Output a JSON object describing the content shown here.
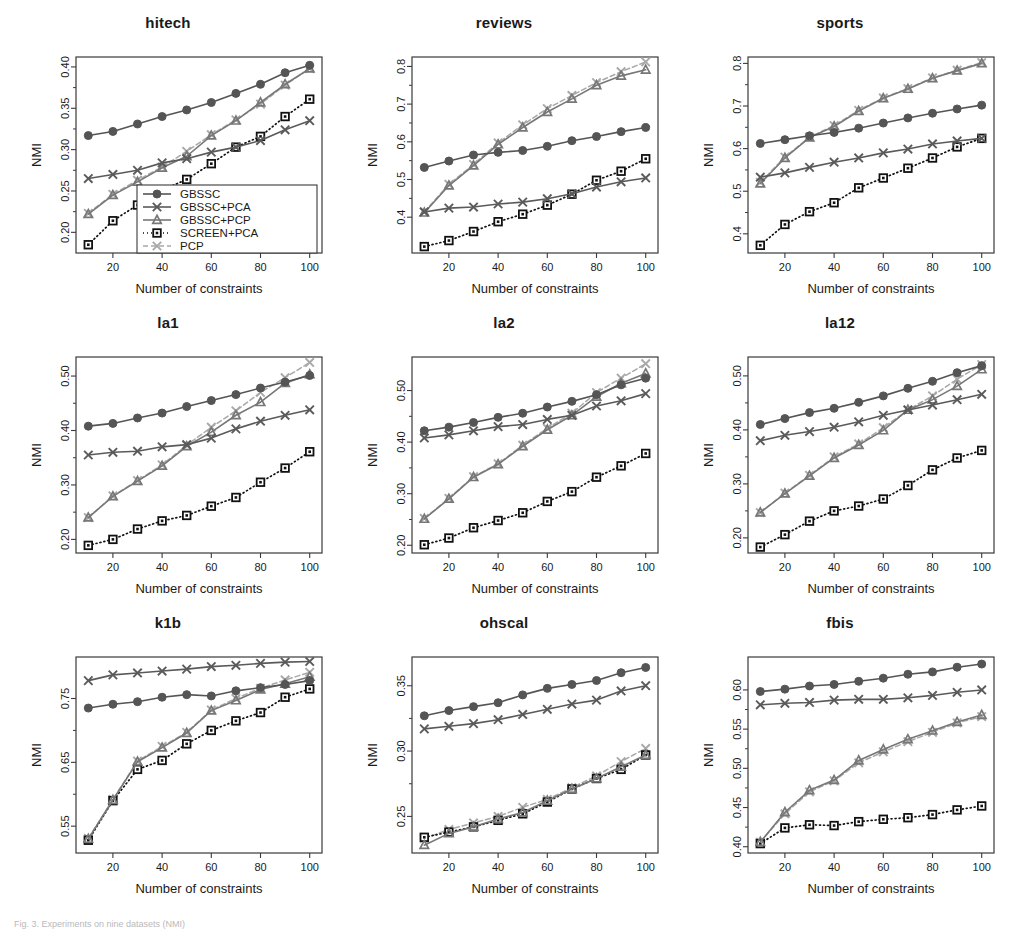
{
  "figure": {
    "caption": "Fig. 3. Experiments on nine datasets (NMI)",
    "xlabel": "Number of constraints",
    "ylabel": "NMI",
    "x_ticks": [
      20,
      40,
      60,
      80,
      100
    ],
    "x_points": [
      10,
      20,
      30,
      40,
      50,
      60,
      70,
      80,
      90,
      100
    ],
    "xlim": [
      5,
      105
    ]
  },
  "legend": {
    "position": "inside-bottom-right-panel-1",
    "entries": [
      {
        "label": "GBSSC",
        "marker": "circle",
        "line": "solid",
        "color": "#555555"
      },
      {
        "label": "GBSSC+PCA",
        "marker": "x",
        "line": "solid",
        "color": "#5a5a5a"
      },
      {
        "label": "GBSSC+PCP",
        "marker": "triangle",
        "line": "solid",
        "color": "#777777"
      },
      {
        "label": "SCREEN+PCA",
        "marker": "square",
        "line": "dotted",
        "color": "#111111"
      },
      {
        "label": "PCP",
        "marker": "x",
        "line": "dashed",
        "color": "#a8a8a8"
      }
    ]
  },
  "colors": {
    "gbssc": "#555555",
    "gbssc_pca": "#5a5a5a",
    "gbssc_pcp": "#777777",
    "screen_pca": "#111111",
    "pcp": "#a8a8a8",
    "axis": "#3a3a3a",
    "background": "#ffffff"
  },
  "chart_data": [
    {
      "type": "line",
      "title": "hitech",
      "xlabel": "Number of constraints",
      "ylabel": "NMI",
      "x": [
        10,
        20,
        30,
        40,
        50,
        60,
        70,
        80,
        90,
        100
      ],
      "xlim": [
        5,
        105
      ],
      "ylim": [
        0.175,
        0.412
      ],
      "y_ticks": [
        0.2,
        0.25,
        0.3,
        0.35,
        0.4
      ],
      "y_tick_labels": [
        "0.20",
        "0.25",
        "0.30",
        "0.35",
        "0.40"
      ],
      "grid": false,
      "series": [
        {
          "name": "GBSSC",
          "values": [
            0.317,
            0.322,
            0.331,
            0.34,
            0.348,
            0.357,
            0.368,
            0.379,
            0.393,
            0.402
          ]
        },
        {
          "name": "GBSSC+PCA",
          "values": [
            0.265,
            0.27,
            0.275,
            0.284,
            0.289,
            0.297,
            0.303,
            0.311,
            0.324,
            0.335
          ]
        },
        {
          "name": "GBSSC+PCP",
          "values": [
            0.222,
            0.245,
            0.261,
            0.278,
            0.292,
            0.317,
            0.335,
            0.357,
            0.379,
            0.398
          ]
        },
        {
          "name": "SCREEN+PCA",
          "values": [
            0.185,
            0.214,
            0.233,
            0.251,
            0.264,
            0.283,
            0.303,
            0.316,
            0.34,
            0.361
          ]
        },
        {
          "name": "PCP",
          "values": [
            0.223,
            0.246,
            0.263,
            0.279,
            0.298,
            0.318,
            0.336,
            0.355,
            0.378,
            0.398
          ]
        }
      ]
    },
    {
      "type": "line",
      "title": "reviews",
      "xlabel": "Number of constraints",
      "ylabel": "NMI",
      "x": [
        10,
        20,
        30,
        40,
        50,
        60,
        70,
        80,
        90,
        100
      ],
      "xlim": [
        5,
        105
      ],
      "ylim": [
        0.305,
        0.825
      ],
      "y_ticks": [
        0.4,
        0.5,
        0.6,
        0.7,
        0.8
      ],
      "y_tick_labels": [
        "0.4",
        "0.5",
        "0.6",
        "0.7",
        "0.8"
      ],
      "grid": false,
      "series": [
        {
          "name": "GBSSC",
          "values": [
            0.532,
            0.549,
            0.565,
            0.572,
            0.577,
            0.588,
            0.603,
            0.614,
            0.627,
            0.638
          ]
        },
        {
          "name": "GBSSC+PCA",
          "values": [
            0.414,
            0.424,
            0.427,
            0.435,
            0.44,
            0.449,
            0.462,
            0.48,
            0.494,
            0.504
          ]
        },
        {
          "name": "GBSSC+PCP",
          "values": [
            0.412,
            0.484,
            0.537,
            0.593,
            0.638,
            0.679,
            0.714,
            0.75,
            0.775,
            0.791
          ]
        },
        {
          "name": "SCREEN+PCA",
          "values": [
            0.322,
            0.338,
            0.362,
            0.388,
            0.408,
            0.432,
            0.461,
            0.498,
            0.522,
            0.555
          ]
        },
        {
          "name": "PCP",
          "values": [
            0.414,
            0.487,
            0.54,
            0.597,
            0.645,
            0.688,
            0.723,
            0.757,
            0.786,
            0.812
          ]
        }
      ]
    },
    {
      "type": "line",
      "title": "sports",
      "xlabel": "Number of constraints",
      "ylabel": "NMI",
      "x": [
        10,
        20,
        30,
        40,
        50,
        60,
        70,
        80,
        90,
        100
      ],
      "xlim": [
        5,
        105
      ],
      "ylim": [
        0.355,
        0.815
      ],
      "y_ticks": [
        0.4,
        0.5,
        0.6,
        0.7,
        0.8
      ],
      "y_tick_labels": [
        "0.4",
        "0.5",
        "0.6",
        "0.7",
        "0.8"
      ],
      "grid": false,
      "series": [
        {
          "name": "GBSSC",
          "values": [
            0.612,
            0.621,
            0.63,
            0.638,
            0.648,
            0.66,
            0.672,
            0.683,
            0.693,
            0.702
          ]
        },
        {
          "name": "GBSSC+PCA",
          "values": [
            0.533,
            0.543,
            0.556,
            0.568,
            0.578,
            0.59,
            0.599,
            0.611,
            0.618,
            0.624
          ]
        },
        {
          "name": "GBSSC+PCP",
          "values": [
            0.518,
            0.578,
            0.626,
            0.652,
            0.688,
            0.718,
            0.74,
            0.765,
            0.783,
            0.8
          ]
        },
        {
          "name": "SCREEN+PCA",
          "values": [
            0.373,
            0.422,
            0.452,
            0.473,
            0.508,
            0.531,
            0.554,
            0.578,
            0.604,
            0.624
          ]
        },
        {
          "name": "PCP",
          "values": [
            0.521,
            0.58,
            0.627,
            0.654,
            0.69,
            0.719,
            0.741,
            0.766,
            0.784,
            0.802
          ]
        }
      ]
    },
    {
      "type": "line",
      "title": "la1",
      "xlabel": "Number of constraints",
      "ylabel": "NMI",
      "x": [
        10,
        20,
        30,
        40,
        50,
        60,
        70,
        80,
        90,
        100
      ],
      "xlim": [
        5,
        105
      ],
      "ylim": [
        0.175,
        0.535
      ],
      "y_ticks": [
        0.2,
        0.3,
        0.4,
        0.5
      ],
      "y_tick_labels": [
        "0.20",
        "0.30",
        "0.40",
        "0.50"
      ],
      "grid": false,
      "series": [
        {
          "name": "GBSSC",
          "values": [
            0.408,
            0.413,
            0.423,
            0.432,
            0.444,
            0.455,
            0.466,
            0.478,
            0.489,
            0.501
          ]
        },
        {
          "name": "GBSSC+PCA",
          "values": [
            0.355,
            0.36,
            0.362,
            0.37,
            0.374,
            0.386,
            0.403,
            0.417,
            0.428,
            0.438
          ]
        },
        {
          "name": "GBSSC+PCP",
          "values": [
            0.24,
            0.279,
            0.307,
            0.335,
            0.371,
            0.397,
            0.428,
            0.452,
            0.487,
            0.503
          ]
        },
        {
          "name": "SCREEN+PCA",
          "values": [
            0.189,
            0.2,
            0.219,
            0.234,
            0.244,
            0.261,
            0.277,
            0.305,
            0.331,
            0.361
          ]
        },
        {
          "name": "PCP",
          "values": [
            0.24,
            0.28,
            0.308,
            0.337,
            0.373,
            0.406,
            0.436,
            0.47,
            0.497,
            0.525
          ]
        }
      ]
    },
    {
      "type": "line",
      "title": "la2",
      "xlabel": "Number of constraints",
      "ylabel": "NMI",
      "x": [
        10,
        20,
        30,
        40,
        50,
        60,
        70,
        80,
        90,
        100
      ],
      "xlim": [
        5,
        105
      ],
      "ylim": [
        0.185,
        0.565
      ],
      "y_ticks": [
        0.2,
        0.3,
        0.4,
        0.5
      ],
      "y_tick_labels": [
        "0.20",
        "0.30",
        "0.40",
        "0.50"
      ],
      "grid": false,
      "series": [
        {
          "name": "GBSSC",
          "values": [
            0.422,
            0.429,
            0.438,
            0.448,
            0.456,
            0.468,
            0.479,
            0.492,
            0.511,
            0.524
          ]
        },
        {
          "name": "GBSSC+PCA",
          "values": [
            0.408,
            0.414,
            0.422,
            0.43,
            0.434,
            0.444,
            0.452,
            0.47,
            0.48,
            0.494
          ]
        },
        {
          "name": "GBSSC+PCP",
          "values": [
            0.251,
            0.29,
            0.332,
            0.357,
            0.392,
            0.424,
            0.452,
            0.488,
            0.514,
            0.533
          ]
        },
        {
          "name": "SCREEN+PCA",
          "values": [
            0.201,
            0.214,
            0.234,
            0.248,
            0.263,
            0.285,
            0.304,
            0.332,
            0.354,
            0.378
          ]
        },
        {
          "name": "PCP",
          "values": [
            0.252,
            0.291,
            0.333,
            0.358,
            0.394,
            0.427,
            0.456,
            0.496,
            0.524,
            0.552
          ]
        }
      ]
    },
    {
      "type": "line",
      "title": "la12",
      "xlabel": "Number of constraints",
      "ylabel": "NMI",
      "x": [
        10,
        20,
        30,
        40,
        50,
        60,
        70,
        80,
        90,
        100
      ],
      "xlim": [
        5,
        105
      ],
      "ylim": [
        0.172,
        0.535
      ],
      "y_ticks": [
        0.2,
        0.3,
        0.4,
        0.5
      ],
      "y_tick_labels": [
        "0.20",
        "0.30",
        "0.40",
        "0.50"
      ],
      "grid": false,
      "series": [
        {
          "name": "GBSSC",
          "values": [
            0.41,
            0.421,
            0.432,
            0.44,
            0.451,
            0.463,
            0.477,
            0.49,
            0.506,
            0.519
          ]
        },
        {
          "name": "GBSSC+PCA",
          "values": [
            0.38,
            0.39,
            0.397,
            0.405,
            0.415,
            0.427,
            0.437,
            0.446,
            0.456,
            0.466
          ]
        },
        {
          "name": "GBSSC+PCP",
          "values": [
            0.247,
            0.282,
            0.315,
            0.348,
            0.372,
            0.399,
            0.437,
            0.456,
            0.481,
            0.512
          ]
        },
        {
          "name": "SCREEN+PCA",
          "values": [
            0.183,
            0.206,
            0.231,
            0.25,
            0.259,
            0.272,
            0.297,
            0.326,
            0.348,
            0.362
          ]
        },
        {
          "name": "PCP",
          "values": [
            0.247,
            0.283,
            0.316,
            0.35,
            0.374,
            0.404,
            0.437,
            0.463,
            0.494,
            0.521
          ]
        }
      ]
    },
    {
      "type": "line",
      "title": "k1b",
      "xlabel": "Number of constraints",
      "ylabel": "NMI",
      "x": [
        10,
        20,
        30,
        40,
        50,
        60,
        70,
        80,
        90,
        100
      ],
      "xlim": [
        5,
        105
      ],
      "ylim": [
        0.508,
        0.815
      ],
      "y_ticks": [
        0.55,
        0.65,
        0.75
      ],
      "y_tick_labels": [
        "0.55",
        "0.65",
        "0.75"
      ],
      "grid": false,
      "series": [
        {
          "name": "GBSSC",
          "values": [
            0.735,
            0.741,
            0.745,
            0.752,
            0.756,
            0.754,
            0.762,
            0.767,
            0.772,
            0.778
          ]
        },
        {
          "name": "GBSSC+PCA",
          "values": [
            0.778,
            0.787,
            0.79,
            0.793,
            0.796,
            0.8,
            0.802,
            0.805,
            0.807,
            0.808
          ]
        },
        {
          "name": "GBSSC+PCP",
          "values": [
            0.53,
            0.591,
            0.651,
            0.673,
            0.696,
            0.731,
            0.747,
            0.764,
            0.773,
            0.784
          ]
        },
        {
          "name": "SCREEN+PCA",
          "values": [
            0.528,
            0.59,
            0.639,
            0.653,
            0.679,
            0.7,
            0.715,
            0.728,
            0.752,
            0.765
          ]
        },
        {
          "name": "PCP",
          "values": [
            0.531,
            0.592,
            0.652,
            0.675,
            0.697,
            0.732,
            0.75,
            0.766,
            0.779,
            0.791
          ]
        }
      ]
    },
    {
      "type": "line",
      "title": "ohscal",
      "xlabel": "Number of constraints",
      "ylabel": "NMI",
      "x": [
        10,
        20,
        30,
        40,
        50,
        60,
        70,
        80,
        90,
        100
      ],
      "xlim": [
        5,
        105
      ],
      "ylim": [
        0.222,
        0.372
      ],
      "y_ticks": [
        0.25,
        0.3,
        0.35
      ],
      "y_tick_labels": [
        "0.25",
        "0.30",
        "0.35"
      ],
      "grid": false,
      "series": [
        {
          "name": "GBSSC",
          "values": [
            0.327,
            0.331,
            0.334,
            0.337,
            0.343,
            0.348,
            0.351,
            0.354,
            0.36,
            0.364
          ]
        },
        {
          "name": "GBSSC+PCA",
          "values": [
            0.317,
            0.319,
            0.321,
            0.324,
            0.328,
            0.332,
            0.336,
            0.339,
            0.346,
            0.35
          ]
        },
        {
          "name": "GBSSC+PCP",
          "values": [
            0.228,
            0.237,
            0.242,
            0.248,
            0.253,
            0.262,
            0.271,
            0.279,
            0.288,
            0.297
          ]
        },
        {
          "name": "SCREEN+PCA",
          "values": [
            0.234,
            0.238,
            0.242,
            0.247,
            0.252,
            0.261,
            0.271,
            0.279,
            0.286,
            0.297
          ]
        },
        {
          "name": "PCP",
          "values": [
            0.233,
            0.24,
            0.245,
            0.25,
            0.257,
            0.263,
            0.272,
            0.281,
            0.292,
            0.302
          ]
        }
      ]
    },
    {
      "type": "line",
      "title": "fbis",
      "xlabel": "Number of constraints",
      "ylabel": "NMI",
      "x": [
        10,
        20,
        30,
        40,
        50,
        60,
        70,
        80,
        90,
        100
      ],
      "xlim": [
        5,
        105
      ],
      "ylim": [
        0.392,
        0.642
      ],
      "y_ticks": [
        0.4,
        0.45,
        0.5,
        0.55,
        0.6
      ],
      "y_tick_labels": [
        "0.40",
        "0.45",
        "0.50",
        "0.55",
        "0.60"
      ],
      "grid": false,
      "series": [
        {
          "name": "GBSSC",
          "values": [
            0.598,
            0.601,
            0.605,
            0.607,
            0.611,
            0.615,
            0.62,
            0.623,
            0.629,
            0.633
          ]
        },
        {
          "name": "GBSSC+PCA",
          "values": [
            0.581,
            0.583,
            0.584,
            0.587,
            0.588,
            0.588,
            0.59,
            0.593,
            0.597,
            0.6
          ]
        },
        {
          "name": "GBSSC+PCP",
          "values": [
            0.406,
            0.444,
            0.472,
            0.485,
            0.51,
            0.524,
            0.537,
            0.548,
            0.559,
            0.568
          ]
        },
        {
          "name": "SCREEN+PCA",
          "values": [
            0.404,
            0.424,
            0.428,
            0.427,
            0.432,
            0.435,
            0.437,
            0.441,
            0.447,
            0.452
          ]
        },
        {
          "name": "PCP",
          "values": [
            0.406,
            0.442,
            0.47,
            0.484,
            0.507,
            0.521,
            0.534,
            0.546,
            0.558,
            0.566
          ]
        }
      ]
    }
  ]
}
